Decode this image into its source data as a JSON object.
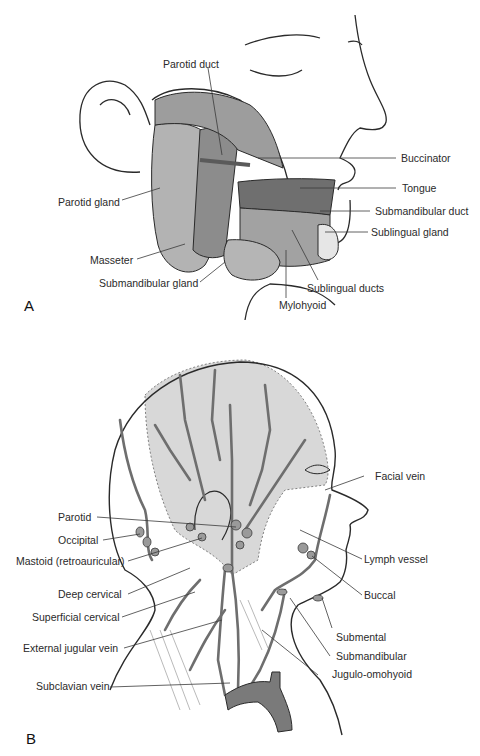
{
  "figure": {
    "panel_a": {
      "letter": "A",
      "labels": {
        "parotid_duct": "Parotid duct",
        "buccinator": "Buccinator",
        "tongue": "Tongue",
        "parotid_gland": "Parotid gland",
        "submandibular_duct": "Submandibular duct",
        "sublingual_gland": "Sublingual gland",
        "masseter": "Masseter",
        "submandibular_gland": "Submandibular gland",
        "sublingual_ducts": "Sublingual ducts",
        "mylohyoid": "Mylohyoid"
      }
    },
    "panel_b": {
      "letter": "B",
      "labels": {
        "facial_vein": "Facial vein",
        "parotid": "Parotid",
        "occipital": "Occipital",
        "mastoid": "Mastoid (retroauricular)",
        "lymph_vessel": "Lymph vessel",
        "deep_cervical": "Deep cervical",
        "buccal": "Buccal",
        "superficial_cervical": "Superficial cervical",
        "submental": "Submental",
        "external_jugular_vein": "External jugular vein",
        "submandibular": "Submandibular",
        "jugulo_omohyoid": "Jugulo-omohyoid",
        "subclavian_vein": "Subclavian vein"
      }
    },
    "colors": {
      "line": "#2a2a2a",
      "gland_fill": "#a8a8a8",
      "muscle_fill": "#8c8c8c",
      "shade_fill": "#d6d6d6",
      "vein_fill": "#7a7a7a"
    }
  }
}
